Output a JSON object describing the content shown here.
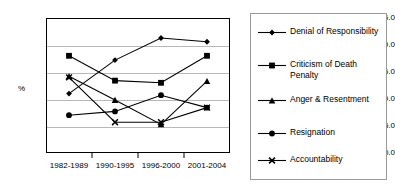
{
  "chart_data": {
    "type": "line",
    "title": "",
    "xlabel": "",
    "ylabel": "%",
    "categories": [
      "1982-1989",
      "1990-1995",
      "1996-2000",
      "2001-2004"
    ],
    "ylim": [
      0.0,
      25.0
    ],
    "ytick_labels": [
      "0.0",
      "5.0",
      "10.0",
      "15.0",
      "20.0",
      "25.0"
    ],
    "ytick_values": [
      0.0,
      5.0,
      10.0,
      15.0,
      20.0,
      25.0
    ],
    "grid": true,
    "legend_position": "right",
    "series": [
      {
        "name": "Denial of Responsibility",
        "marker": "diamond",
        "values": [
          11.0,
          17.2,
          21.3,
          20.6
        ]
      },
      {
        "name": "Criticism of Death Penalty",
        "marker": "square",
        "values": [
          18.0,
          13.4,
          13.0,
          18.0
        ]
      },
      {
        "name": "Anger & Resentment",
        "marker": "triangle",
        "values": [
          14.2,
          9.8,
          5.3,
          13.3
        ]
      },
      {
        "name": "Resignation",
        "marker": "circle",
        "values": [
          7.0,
          7.7,
          10.7,
          8.4
        ]
      },
      {
        "name": "Accountability",
        "marker": "cross",
        "values": [
          14.0,
          5.7,
          5.7,
          8.4
        ]
      }
    ]
  },
  "legend": {
    "entries": [
      {
        "label": "Denial of Responsibility"
      },
      {
        "label": "Criticism of Death Penalty"
      },
      {
        "label": "Anger & Resentment"
      },
      {
        "label": "Resignation"
      },
      {
        "label": "Accountability"
      }
    ]
  },
  "colors": {
    "line": "#000000",
    "grid": "#b8b8b8",
    "frame": "#000000",
    "background": "#ffffff"
  }
}
